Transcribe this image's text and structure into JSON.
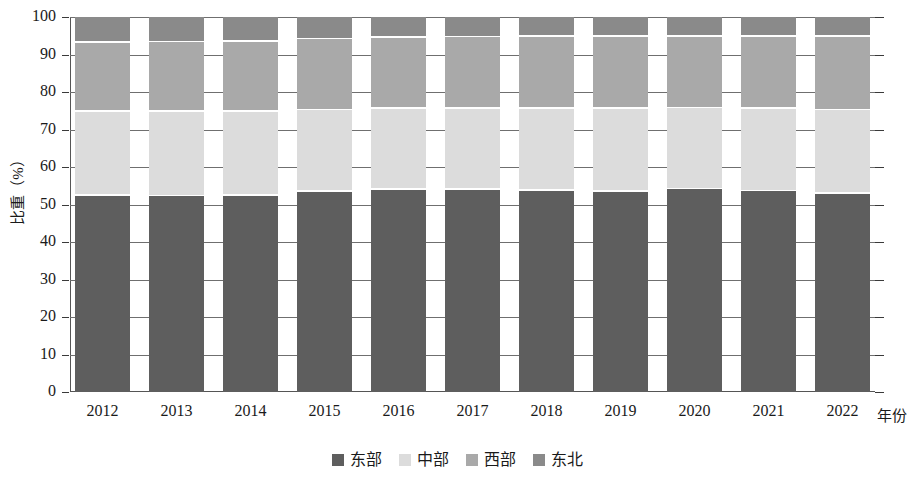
{
  "chart_data": {
    "type": "bar",
    "subtype": "stacked-percentage",
    "title": "",
    "xlabel": "年份",
    "ylabel": "比重（%）",
    "ylim": [
      0,
      100
    ],
    "ytick_values": [
      0,
      10,
      20,
      30,
      40,
      50,
      60,
      70,
      80,
      90,
      100
    ],
    "ytick_labels": [
      "0",
      "10",
      "20",
      "30",
      "40",
      "50",
      "60",
      "70",
      "80",
      "90",
      "100"
    ],
    "grid": true,
    "legend_position": "bottom",
    "categories": [
      "2012",
      "2013",
      "2014",
      "2015",
      "2016",
      "2017",
      "2018",
      "2019",
      "2020",
      "2021",
      "2022"
    ],
    "series": [
      {
        "name": "东部",
        "color": "#5e5e5e",
        "values": [
          52.3,
          52.2,
          52.4,
          53.4,
          54.0,
          53.9,
          53.7,
          53.4,
          54.1,
          53.6,
          52.9
        ]
      },
      {
        "name": "中部",
        "color": "#dcdcdc",
        "values": [
          22.4,
          22.5,
          22.4,
          21.8,
          21.5,
          21.6,
          21.8,
          22.1,
          21.6,
          22.0,
          22.2
        ]
      },
      {
        "name": "西部",
        "color": "#a9a9a9",
        "values": [
          18.5,
          18.6,
          18.6,
          18.9,
          19.0,
          19.1,
          19.2,
          19.3,
          19.1,
          19.2,
          19.6
        ]
      },
      {
        "name": "东北",
        "color": "#8a8a8a",
        "values": [
          6.8,
          6.7,
          6.6,
          5.9,
          5.5,
          5.4,
          5.3,
          5.2,
          5.2,
          5.2,
          5.3
        ]
      }
    ]
  },
  "legend": {
    "items": [
      {
        "label": "东部",
        "color": "#5e5e5e"
      },
      {
        "label": "中部",
        "color": "#dcdcdc"
      },
      {
        "label": "西部",
        "color": "#a9a9a9"
      },
      {
        "label": "东北",
        "color": "#8a8a8a"
      }
    ]
  },
  "axes": {
    "y_title": "比重（%）",
    "x_title": "年份"
  }
}
